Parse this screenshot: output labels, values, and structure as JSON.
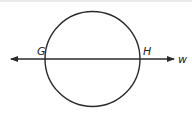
{
  "diagram": {
    "circle": {
      "cx": 92.5,
      "cy": 59,
      "r": 47.5,
      "stroke": "#2a2a2a"
    },
    "line": {
      "x1": 10,
      "y1": 59,
      "x2": 176,
      "y2": 59,
      "stroke": "#2a2a2a",
      "arrows": "both"
    },
    "labels": {
      "point_g": "G",
      "point_h": "H",
      "line_name": "w"
    }
  }
}
